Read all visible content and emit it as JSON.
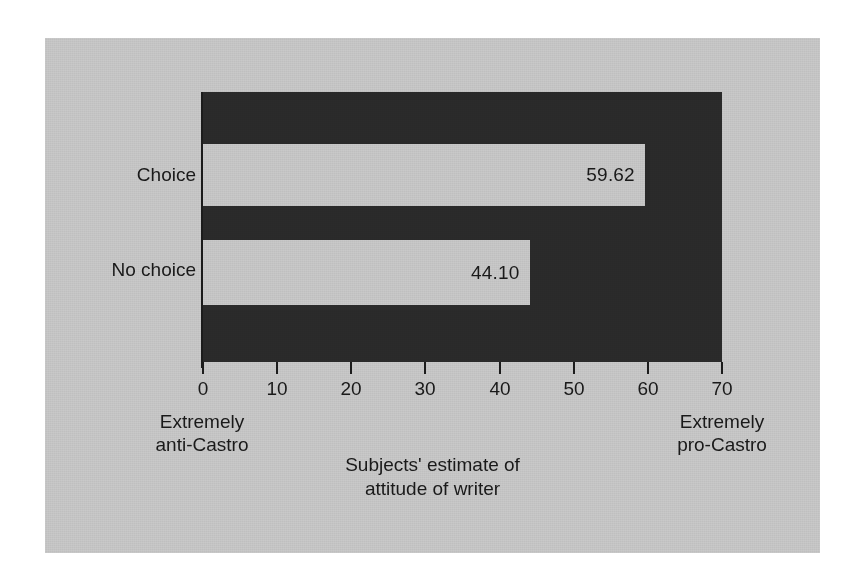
{
  "figure": {
    "background_color": "#c9c9c9",
    "plot_background_color": "#2b2b2b",
    "bar_color": "#c9c9c9",
    "text_color": "#1a1a1a"
  },
  "chart_data": {
    "type": "bar",
    "orientation": "horizontal",
    "title": "",
    "categories": [
      "Choice",
      "No choice"
    ],
    "values": [
      59.62,
      44.1
    ],
    "value_labels": [
      "59.62",
      "44.10"
    ],
    "xlabel": "Subjects' estimate of attitude of writer",
    "xlabel_line1": "Subjects' estimate of",
    "xlabel_line2": "attitude of writer",
    "ylabel": "",
    "xlim": [
      0,
      70
    ],
    "xticks": [
      0,
      10,
      20,
      30,
      40,
      50,
      60,
      70
    ],
    "xtick_labels": [
      "0",
      "10",
      "20",
      "30",
      "40",
      "50",
      "60",
      "70"
    ],
    "grid": false,
    "legend": false,
    "axis_anchor_low_line1": "Extremely",
    "axis_anchor_low_line2": "anti-Castro",
    "axis_anchor_high_line1": "Extremely",
    "axis_anchor_high_line2": "pro-Castro"
  }
}
